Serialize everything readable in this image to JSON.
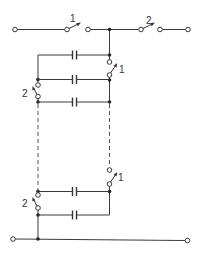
{
  "diagram": {
    "type": "circuit-schematic",
    "colors": {
      "line": "#3a3a3a",
      "background": "#ffffff"
    },
    "labels": {
      "top_switch_1": "1",
      "top_switch_2": "2",
      "upper_right_switch": "1",
      "upper_left_switch": "2",
      "lower_right_switch": "1",
      "lower_left_switch": "2"
    },
    "components": {
      "capacitors": 5,
      "switches": 6,
      "terminals": 4,
      "dashed_continuation_lines": 2
    }
  }
}
